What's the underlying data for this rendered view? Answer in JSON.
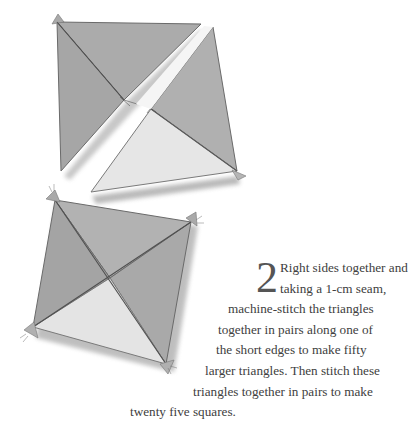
{
  "step": {
    "number": "2",
    "lines": [
      "Right sides together and",
      "taking a 1-cm seam,",
      "machine-stitch the triangles",
      "together in pairs along one of",
      "the short edges to make fifty",
      "larger triangles. Then stitch these",
      "triangles together in pairs to make",
      "twenty five squares."
    ]
  },
  "illustration": {
    "top_figure": "two-triangles-pair-being-joined",
    "bottom_figure": "completed-square-of-four-triangles",
    "colors": {
      "dark_fabric": "#a9a9a9",
      "mid_fabric": "#b4b4b4",
      "light_fabric": "#e4e4e4",
      "stitch_line": "#555555",
      "shadow": "#8a8a8a"
    }
  }
}
